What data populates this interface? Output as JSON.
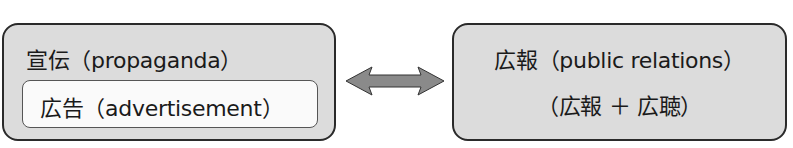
{
  "left_box": {
    "title": "宣伝（propaganda）",
    "inner": {
      "label": "広告（advertisement）"
    }
  },
  "connector": {
    "type": "double-headed-arrow",
    "color": "#8a8a8a"
  },
  "right_box": {
    "title": "広報（public relations）",
    "subtitle": "（広報 ＋ 広聴）"
  }
}
